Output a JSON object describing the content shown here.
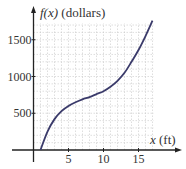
{
  "chart_data": {
    "type": "line",
    "title": "",
    "xlabel": "x (ft)",
    "ylabel": "f(x) (dollars)",
    "xlabel_parts": {
      "var": "x",
      "unit": " (ft)"
    },
    "ylabel_parts": {
      "var": "f(x)",
      "unit": " (dollars)"
    },
    "x_ticks": [
      5,
      10,
      15
    ],
    "y_ticks": [
      500,
      1000,
      1500
    ],
    "xlim": [
      0,
      18
    ],
    "ylim": [
      0,
      1800
    ],
    "grid": true,
    "grid_minor_x": 1,
    "grid_minor_y": 100,
    "series": [
      {
        "name": "f(x)",
        "color": "#3a3a6a",
        "x": [
          1,
          2,
          3,
          4,
          5,
          6,
          7,
          8,
          9,
          10,
          11,
          12,
          13,
          14,
          15,
          16,
          17
        ],
        "y": [
          0,
          250,
          420,
          530,
          600,
          650,
          690,
          720,
          760,
          800,
          860,
          940,
          1050,
          1200,
          1360,
          1550,
          1760
        ]
      }
    ]
  }
}
